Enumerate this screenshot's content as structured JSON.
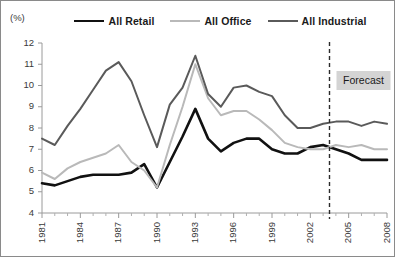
{
  "unit_label": "(%)",
  "legend": {
    "items": [
      {
        "label": "All Retail",
        "color": "#111111",
        "width": 2.6
      },
      {
        "label": "All Office",
        "color": "#b9b9b9",
        "width": 2.0
      },
      {
        "label": "All Industrial",
        "color": "#5a5a5a",
        "width": 2.0
      }
    ]
  },
  "annotations": {
    "forecast_label": "Forecast",
    "forecast_start_year": 2003.5,
    "forecast_box_color": "#d4d4d4"
  },
  "chart_data": {
    "type": "line",
    "title": "",
    "subtitle": "",
    "xlabel": "",
    "ylabel": "(%)",
    "ylim": [
      4,
      12
    ],
    "xlim": [
      1981,
      2008
    ],
    "yticks": [
      4,
      5,
      6,
      7,
      8,
      9,
      10,
      11,
      12
    ],
    "xticks_labeled": [
      1981,
      1984,
      1987,
      1990,
      1993,
      1996,
      1999,
      2002,
      2005,
      2008
    ],
    "grid": false,
    "legend_position": "top-center",
    "x": [
      1981,
      1982,
      1983,
      1984,
      1985,
      1986,
      1987,
      1988,
      1989,
      1990,
      1991,
      1992,
      1993,
      1994,
      1995,
      1996,
      1997,
      1998,
      1999,
      2000,
      2001,
      2002,
      2003,
      2004,
      2005,
      2006,
      2007,
      2008
    ],
    "series": [
      {
        "name": "All Retail",
        "color": "#111111",
        "width": 2.6,
        "values": [
          5.4,
          5.3,
          5.5,
          5.7,
          5.8,
          5.8,
          5.8,
          5.9,
          6.3,
          5.2,
          6.4,
          7.6,
          8.9,
          7.5,
          6.9,
          7.3,
          7.5,
          7.5,
          7.0,
          6.8,
          6.8,
          7.1,
          7.2,
          7.0,
          6.8,
          6.5,
          6.5,
          6.5
        ]
      },
      {
        "name": "All Office",
        "color": "#b9b9b9",
        "width": 2.0,
        "values": [
          5.9,
          5.6,
          6.1,
          6.4,
          6.6,
          6.8,
          7.2,
          6.4,
          6.0,
          5.2,
          7.2,
          9.0,
          11.0,
          9.4,
          8.6,
          8.8,
          8.8,
          8.4,
          7.9,
          7.3,
          7.1,
          7.0,
          7.0,
          7.2,
          7.1,
          7.2,
          7.0,
          7.0
        ]
      },
      {
        "name": "All Industrial",
        "color": "#5a5a5a",
        "width": 2.0,
        "values": [
          7.5,
          7.2,
          8.1,
          8.9,
          9.8,
          10.7,
          11.1,
          10.2,
          8.6,
          7.1,
          9.1,
          9.9,
          11.4,
          9.6,
          9.0,
          9.9,
          10.0,
          9.7,
          9.5,
          8.6,
          8.0,
          8.0,
          8.2,
          8.3,
          8.3,
          8.1,
          8.3,
          8.2
        ]
      }
    ]
  }
}
